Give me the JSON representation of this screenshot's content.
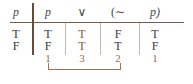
{
  "table": {
    "headers": [
      "p",
      "p",
      "∨",
      "(∼",
      "p)"
    ],
    "rows": [
      [
        "T",
        "T",
        "T",
        "F",
        "T"
      ],
      [
        "F",
        "F",
        "T",
        "T",
        "F"
      ]
    ],
    "step_numbers": [
      "1",
      "3",
      "2",
      "1"
    ],
    "main_column": "∨"
  },
  "colors": {
    "text": "#3a3a3a",
    "accent": "#8a5a3e",
    "rule": "#7a5a48"
  }
}
